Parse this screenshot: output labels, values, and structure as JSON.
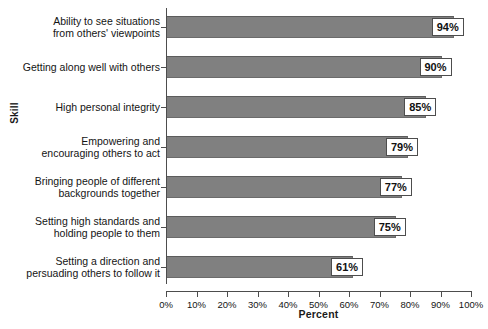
{
  "chart_data": {
    "type": "bar",
    "orientation": "horizontal",
    "title": "",
    "xlabel": "Percent",
    "ylabel": "Skill",
    "xlim": [
      0,
      100
    ],
    "grid": false,
    "legend": null,
    "categories": [
      "Ability to see situations\nfrom others' viewpoints",
      "Getting along well with others",
      "High personal integrity",
      "Empowering and\nencouraging others to act",
      "Bringing people of different\nbackgrounds together",
      "Setting high standards and\nholding people to them",
      "Setting a direction and\npersuading others to follow it"
    ],
    "values": [
      94,
      90,
      85,
      79,
      77,
      75,
      61
    ],
    "value_labels": [
      "94%",
      "90%",
      "85%",
      "79%",
      "77%",
      "75%",
      "61%"
    ],
    "xticks": [
      0,
      10,
      20,
      30,
      40,
      50,
      60,
      70,
      80,
      90,
      100
    ],
    "xtick_labels": [
      "0%",
      "10%",
      "20%",
      "30%",
      "40%",
      "50%",
      "60%",
      "70%",
      "80%",
      "90%",
      "100%"
    ],
    "colors": {
      "bar_fill": "#808080",
      "bar_edge": "#5c5c5c",
      "axis": "#4d4d4d",
      "text": "#141414",
      "label_box_fill": "#ffffff",
      "label_box_border": "#4d4d4d",
      "background": "#ffffff"
    }
  }
}
